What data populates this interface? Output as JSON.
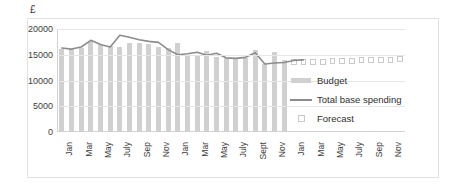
{
  "chart_data": {
    "type": "bar",
    "title": "",
    "subtitle": "",
    "xlabel": "",
    "ylabel": "£",
    "ylim": [
      0,
      20000
    ],
    "yticks": [
      0,
      5000,
      10000,
      15000,
      20000
    ],
    "ytick_labels": [
      "0",
      "5000",
      "10000",
      "15000",
      "20000"
    ],
    "grid": true,
    "legend_position": "right",
    "categories": [
      "Jan",
      "Feb",
      "Mar",
      "Apr",
      "May",
      "June",
      "July",
      "Aug",
      "Sep",
      "Oct",
      "Nov",
      "Dec",
      "Jan",
      "Feb",
      "Mar",
      "Apr",
      "May",
      "June",
      "July",
      "Aug",
      "Sept",
      "Oct",
      "Nov",
      "Dec",
      "Jan",
      "Feb",
      "Mar",
      "Apr",
      "May",
      "June",
      "July",
      "Aug",
      "Sep",
      "Oct",
      "Nov",
      "Dec"
    ],
    "xtick_labels": [
      "Jan",
      "",
      "Mar",
      "",
      "May",
      "",
      "July",
      "",
      "Sep",
      "",
      "Nov",
      "",
      "Jan",
      "",
      "Mar",
      "",
      "May",
      "",
      "July",
      "",
      "Sept",
      "",
      "Nov",
      "",
      "Jan",
      "",
      "Mar",
      "",
      "May",
      "",
      "July",
      "",
      "Sep",
      "",
      "Nov",
      ""
    ],
    "series": [
      {
        "name": "Budget",
        "type": "bar",
        "color": "#d0d0d0",
        "values": [
          16200,
          16100,
          16400,
          17600,
          16900,
          16700,
          16600,
          17300,
          17300,
          17000,
          16500,
          16300,
          17300,
          14900,
          15000,
          15800,
          14500,
          14400,
          14400,
          14400,
          16000,
          13300,
          15600,
          14000,
          null,
          null,
          null,
          null,
          null,
          null,
          null,
          null,
          null,
          null,
          null,
          null
        ]
      },
      {
        "name": "Total base spending",
        "type": "line",
        "color": "#8c8c8c",
        "values": [
          16300,
          16100,
          16500,
          17800,
          17000,
          16500,
          18800,
          18400,
          17900,
          17600,
          17400,
          16000,
          15000,
          15200,
          15500,
          14900,
          15300,
          14400,
          14300,
          14500,
          15400,
          13200,
          13400,
          13500,
          13900,
          14000,
          null,
          null,
          null,
          null,
          null,
          null,
          null,
          null,
          null,
          null
        ]
      },
      {
        "name": "Forecast",
        "type": "marker",
        "color": "#ffffff",
        "edge_color": "#c9c9c9",
        "values": [
          null,
          null,
          null,
          null,
          null,
          null,
          null,
          null,
          null,
          null,
          null,
          null,
          null,
          null,
          null,
          null,
          null,
          null,
          null,
          null,
          null,
          null,
          null,
          null,
          13600,
          13600,
          13600,
          13600,
          13700,
          13700,
          13800,
          13900,
          13900,
          14000,
          14000,
          14100
        ]
      }
    ],
    "legend": [
      {
        "label": "Budget",
        "key": "bar-swatch"
      },
      {
        "label": "Total base spending",
        "key": "line-swatch"
      },
      {
        "label": "Forecast",
        "key": "open-square-swatch"
      }
    ],
    "colors": {
      "bar": "#d0d0d0",
      "line": "#8c8c8c",
      "forecast_edge": "#c9c9c9",
      "grid": "#e6e6e6",
      "frame": "#e2e2e2",
      "text": "#3a3a3a"
    }
  }
}
